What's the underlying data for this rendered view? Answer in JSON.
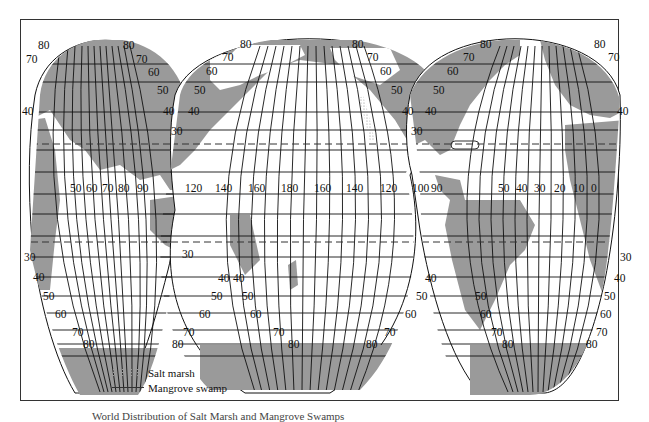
{
  "map": {
    "title": "World Distribution of Salt Marsh and Mangrove Swamps",
    "projection": "interrupted homolosine (three lobes)",
    "colors": {
      "land": "#9a9a9a",
      "ocean": "#ffffff",
      "grid": "#111111",
      "tropic": "#333333",
      "frame": "#333333"
    },
    "lobes": [
      {
        "name": "Indian Ocean lobe",
        "longitude_labels": [
          "50",
          "60",
          "70",
          "80",
          "90",
          "120"
        ],
        "latitude_labels_north": [
          "80",
          "70",
          "40",
          "80",
          "70",
          "60",
          "50",
          "40",
          "30"
        ],
        "latitude_labels_south": [
          "30",
          "40",
          "50",
          "60",
          "70",
          "80",
          "30",
          "40",
          "50",
          "60",
          "70",
          "80"
        ]
      },
      {
        "name": "Pacific Ocean lobe",
        "longitude_labels": [
          "140",
          "160",
          "180",
          "160",
          "140",
          "120",
          "100"
        ],
        "latitude_labels_north": [
          "80",
          "70",
          "60",
          "50",
          "40",
          "80",
          "70",
          "60",
          "50",
          "40",
          "30"
        ],
        "latitude_labels_south": [
          "40",
          "50",
          "60",
          "70",
          "80",
          "40",
          "50",
          "60",
          "70",
          "80"
        ]
      },
      {
        "name": "Atlantic Ocean lobe",
        "longitude_labels": [
          "90",
          "50",
          "40",
          "30",
          "20",
          "10",
          "0"
        ],
        "latitude_labels_north": [
          "80",
          "70",
          "60",
          "50",
          "40",
          "80",
          "70",
          "40"
        ],
        "latitude_labels_south": [
          "50",
          "60",
          "70",
          "80",
          "30",
          "40",
          "50",
          "60",
          "70",
          "80"
        ]
      }
    ]
  },
  "legend": {
    "items": [
      {
        "symbol": "stipple",
        "label": "Salt marsh"
      },
      {
        "symbol": "line",
        "label": "Mangrove swamp"
      }
    ]
  },
  "caption": "World Distribution of Salt Marsh and Mangrove Swamps"
}
